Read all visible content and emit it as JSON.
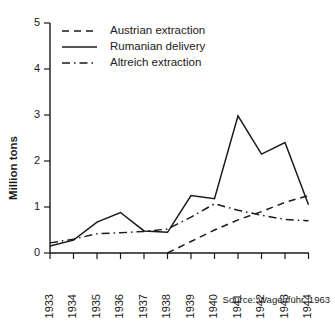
{
  "chart_data": {
    "type": "line",
    "title": "",
    "xlabel": "",
    "ylabel": "Million tons",
    "categories": [
      "1933",
      "1934",
      "1935",
      "1936",
      "1937",
      "1938",
      "1939",
      "1940",
      "1941",
      "1942",
      "1943",
      "1944"
    ],
    "x": [
      1933,
      1934,
      1935,
      1936,
      1937,
      1938,
      1939,
      1940,
      1941,
      1942,
      1943,
      1944
    ],
    "xlim": [
      1933,
      1944
    ],
    "ylim": [
      0,
      5
    ],
    "yticks": [
      0,
      1,
      2,
      3,
      4,
      5
    ],
    "ytick_labels": [
      "0",
      "1",
      "2",
      "3",
      "4",
      "5"
    ],
    "grid": false,
    "legend_position": "top-left",
    "series": [
      {
        "name": "Austrian extraction",
        "style": "dashed",
        "color": "#1a1a1a",
        "x": [
          1938,
          1939,
          1940,
          1941,
          1942,
          1943,
          1944
        ],
        "values": [
          0.0,
          0.25,
          0.5,
          0.72,
          0.9,
          1.1,
          1.25
        ]
      },
      {
        "name": "Rumanian delivery",
        "style": "solid",
        "color": "#1a1a1a",
        "x": [
          1933,
          1934,
          1935,
          1936,
          1937,
          1938,
          1939,
          1940,
          1941,
          1942,
          1943,
          1944
        ],
        "values": [
          0.15,
          0.28,
          0.67,
          0.88,
          0.48,
          0.45,
          1.25,
          1.18,
          2.98,
          2.15,
          2.4,
          1.05
        ]
      },
      {
        "name": "Altreich extraction",
        "style": "dashdot",
        "color": "#1a1a1a",
        "x": [
          1933,
          1934,
          1935,
          1936,
          1937,
          1938,
          1939,
          1940,
          1941,
          1942,
          1943,
          1944
        ],
        "values": [
          0.22,
          0.3,
          0.42,
          0.44,
          0.47,
          0.52,
          0.78,
          1.07,
          0.93,
          0.82,
          0.73,
          0.7
        ]
      }
    ],
    "annotations": [
      {
        "name": "source-note",
        "text": "Source: Wagenführ, 1963"
      }
    ]
  },
  "legend": {
    "items": [
      {
        "label": "Austrian extraction",
        "style": "dashed"
      },
      {
        "label": "Rumanian delivery",
        "style": "solid"
      },
      {
        "label": "Altreich extraction",
        "style": "dashdot"
      }
    ]
  },
  "axes": {
    "y_axis_label": "Million tons",
    "y_ticks": [
      "0",
      "1",
      "2",
      "3",
      "4",
      "5"
    ],
    "x_ticks": [
      "1933",
      "1934",
      "1935",
      "1936",
      "1937",
      "1938",
      "1939",
      "1940",
      "1941",
      "1942",
      "1943",
      "1944"
    ]
  },
  "footer": {
    "source": "Source: Wagenführ, 1963"
  }
}
